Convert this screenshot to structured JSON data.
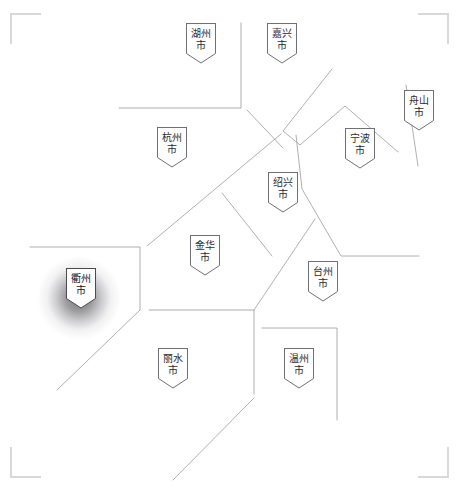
{
  "map": {
    "title": "浙江省地级市分布图",
    "background_color": "#ffffff",
    "boundary_color": "#9a9aa2",
    "frame_color": "#d8d8dc",
    "marker_fill": "#ffffff",
    "marker_border": "#6f6f78",
    "label_color": "#2b2b31",
    "highlight_color": "#17171c",
    "highlight_glow_color": "#282a2d"
  },
  "frame": {
    "corners": [
      {
        "name": "top-left"
      },
      {
        "name": "top-right"
      },
      {
        "name": "bottom-left"
      },
      {
        "name": "bottom-right"
      }
    ]
  },
  "cities": [
    {
      "id": "huzhou",
      "label": "湖州\n市",
      "name": "湖州市",
      "x": 186,
      "y": 23,
      "highlighted": false
    },
    {
      "id": "jiaxing",
      "label": "嘉兴\n市",
      "name": "嘉兴市",
      "x": 267,
      "y": 23,
      "highlighted": false
    },
    {
      "id": "zhoushan",
      "label": "舟山\n市",
      "name": "舟山市",
      "x": 404,
      "y": 90,
      "highlighted": false
    },
    {
      "id": "hangzhou",
      "label": "杭州\n市",
      "name": "杭州市",
      "x": 157,
      "y": 127,
      "highlighted": false
    },
    {
      "id": "ningbo",
      "label": "宁波\n市",
      "name": "宁波市",
      "x": 345,
      "y": 128,
      "highlighted": false
    },
    {
      "id": "shaoxing",
      "label": "绍兴\n市",
      "name": "绍兴市",
      "x": 268,
      "y": 172,
      "highlighted": false
    },
    {
      "id": "jinhua",
      "label": "金华\n市",
      "name": "金华市",
      "x": 190,
      "y": 235,
      "highlighted": false
    },
    {
      "id": "taizhou",
      "label": "台州\n市",
      "name": "台州市",
      "x": 308,
      "y": 261,
      "highlighted": false
    },
    {
      "id": "quzhou",
      "label": "衢州\n市",
      "name": "衢州市",
      "x": 66,
      "y": 268,
      "highlighted": true
    },
    {
      "id": "lishui",
      "label": "丽水\n市",
      "name": "丽水市",
      "x": 158,
      "y": 348,
      "highlighted": false
    },
    {
      "id": "wenzhou",
      "label": "温州\n市",
      "name": "温州市",
      "x": 284,
      "y": 348,
      "highlighted": false
    }
  ],
  "chart_data": {
    "type": "map",
    "region": "浙江省",
    "unit": "地级市",
    "count": 11,
    "legend": [],
    "highlighted_region": "衢州市",
    "regions": [
      {
        "name": "湖州市",
        "highlighted": false
      },
      {
        "name": "嘉兴市",
        "highlighted": false
      },
      {
        "name": "舟山市",
        "highlighted": false
      },
      {
        "name": "杭州市",
        "highlighted": false
      },
      {
        "name": "宁波市",
        "highlighted": false
      },
      {
        "name": "绍兴市",
        "highlighted": false
      },
      {
        "name": "金华市",
        "highlighted": false
      },
      {
        "name": "台州市",
        "highlighted": false
      },
      {
        "name": "衢州市",
        "highlighted": true
      },
      {
        "name": "丽水市",
        "highlighted": false
      },
      {
        "name": "温州市",
        "highlighted": false
      }
    ]
  }
}
